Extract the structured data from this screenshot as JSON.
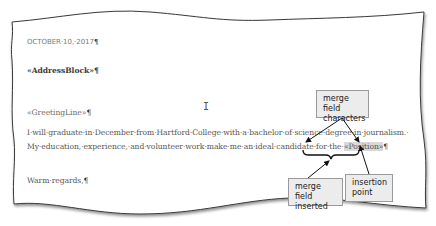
{
  "document": {
    "date_line": "OCTOBER·10,·2017",
    "address_block": "«AddressBlock»",
    "greeting_line": "«GreetingLine»",
    "body_line_1": "I·will·graduate·in·December·from·Hartford·College·with·a·bachelor·of·science·degree·in·journalism.·",
    "body_line_2_prefix": "My·education,·experience,·and·volunteer·work·make·me·an·ideal·candidate·for·the·",
    "body_line_2_field": "«Position»",
    "closing": "Warm·regards,",
    "pilcrow": "¶"
  },
  "cursor": {
    "glyph": "I"
  },
  "callouts": {
    "merge_field_characters": [
      "merge field",
      "characters"
    ],
    "merge_field_inserted": [
      "merge field",
      "inserted"
    ],
    "insertion_point": [
      "insertion",
      "point"
    ]
  },
  "colors": {
    "callout_fill": "#ececec",
    "callout_border": "#9a9a9a",
    "field_highlight": "#d9d9d9",
    "page_edge": "#3a3a3a"
  }
}
